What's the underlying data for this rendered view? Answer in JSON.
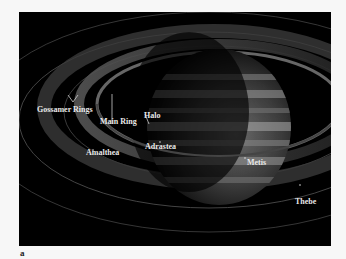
{
  "figure": {
    "panel_label": "a",
    "labels": {
      "gossamer_rings": "Gossamer Rings",
      "main_ring": "Main Ring",
      "halo": "Halo",
      "amalthea": "Amalthea",
      "adrastea": "Adrastea",
      "metis": "Metis",
      "thebe": "Thebe"
    },
    "colors": {
      "background": "#000000",
      "page": "#f7f7f7",
      "label_text": "#e8e8e8"
    }
  }
}
